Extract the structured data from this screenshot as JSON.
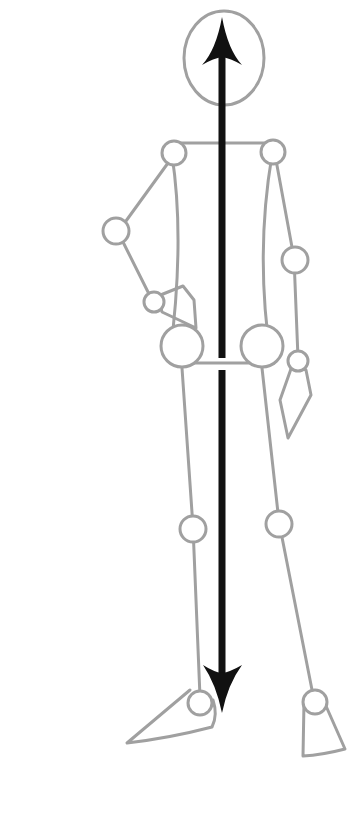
{
  "figure": {
    "colors": {
      "skeleton_stroke": "#a0a0a0",
      "arrow": "#111111",
      "background": "#ffffff"
    },
    "parts": [
      "head",
      "shoulder-line",
      "torso",
      "left-arm-bent-hand-on-hip",
      "right-arm-hanging",
      "hip-line",
      "left-leg",
      "right-leg",
      "left-foot",
      "right-foot"
    ],
    "arrow": {
      "type": "double-headed",
      "orientation": "vertical",
      "meaning": "line of balance / gravity"
    }
  }
}
